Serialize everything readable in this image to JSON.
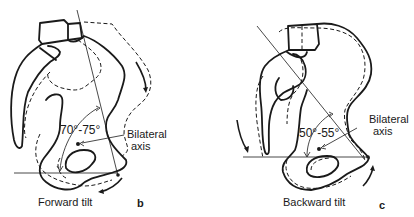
{
  "figure": {
    "panels": [
      {
        "id": "b",
        "letter": "b",
        "caption": "Forward tilt",
        "angle_label": "70°-75°",
        "axis_label_line1": "Bilateral",
        "axis_label_line2": "axis"
      },
      {
        "id": "c",
        "letter": "c",
        "caption": "Backward tilt",
        "angle_label": "50°-55°",
        "axis_label_line1": "Bilateral",
        "axis_label_line2": "axis"
      }
    ],
    "colors": {
      "line": "#1a1a1a",
      "background": "#ffffff"
    }
  }
}
